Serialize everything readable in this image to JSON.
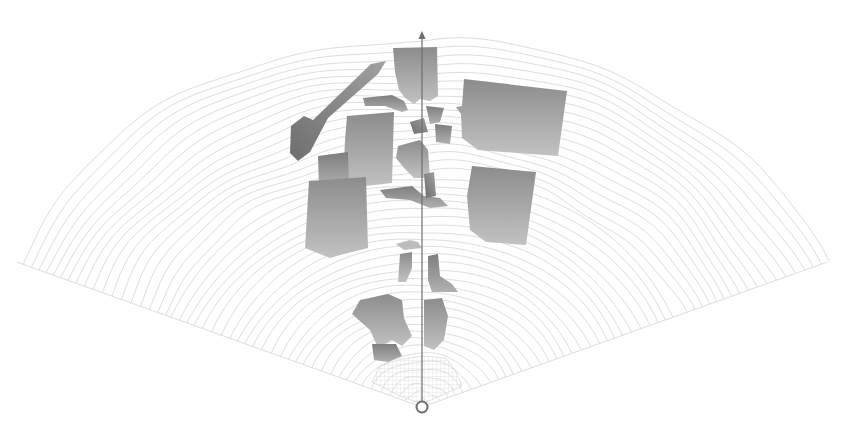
{
  "canvas": {
    "width": 858,
    "height": 440,
    "background": "#ffffff"
  },
  "origin": {
    "x": 422,
    "y": 407,
    "ring_radius": 6
  },
  "axis": {
    "x": 422,
    "y_top": 33,
    "y_bottom": 401,
    "color": "#6e6e6e"
  },
  "fan": {
    "line_color": "#cfcfcf",
    "ring_count": 48,
    "ring_step": 7.6,
    "left_angle_deg": -68,
    "right_angle_deg": 68
  },
  "colors": {
    "shape_top": "#8a8a8a",
    "shape_bottom": "#c4c4c4",
    "shape_dark": "#7a7a7a",
    "grid_region": "#dcdcdc"
  },
  "labels": []
}
